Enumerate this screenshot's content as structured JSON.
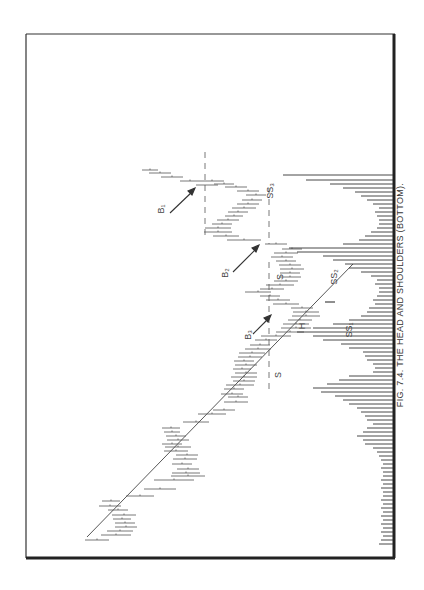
{
  "caption": "FIG. 7.4.  THE HEAD AND SHOULDERS (BOTTOM).",
  "labels": {
    "b1": "B₁",
    "b2": "B₂",
    "b3": "B₃",
    "ss1": "SS₁",
    "ss2": "SS₂",
    "ss3": "SS₃",
    "h": "H",
    "s_left": "S",
    "s_right": "S"
  },
  "colors": {
    "ink": "#333333",
    "frame": "#222222",
    "background": "#ffffff"
  },
  "chart_data": {
    "type": "bar",
    "title": "Fig. 7.4. The Head and Shoulders (Bottom)",
    "orientation": "rotated 90° counter-clockwise (time runs bottom-to-top, price increases to the left)",
    "subcharts": [
      {
        "name": "price",
        "type": "range-bar (high-low with close tick)",
        "description": "Declining price series forming a head-and-shoulders bottom: left shoulder S, head H, right shoulder S, with neckline (dashed) and breakouts B1, B2, B3; downtrend line drawn across tops.",
        "annotations": [
          "S (left shoulder)",
          "H (head)",
          "S (right shoulder)",
          "SS1",
          "SS2",
          "SS3",
          "B1",
          "B2",
          "B3",
          "trendline",
          "neckline (dashed)"
        ]
      },
      {
        "name": "volume",
        "type": "bar",
        "description": "Volume bars extending from the right axis; heavy volume near the left shoulder, head, and breakout areas, light volume elsewhere."
      }
    ],
    "xlabel": "",
    "ylabel": "",
    "grid": false,
    "legend": null
  }
}
